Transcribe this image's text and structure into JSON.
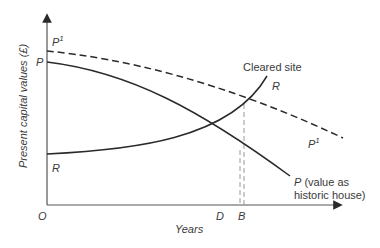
{
  "diagram": {
    "axes": {
      "y_label": "Present capital values (£)",
      "x_label": "Years",
      "origin": "O"
    },
    "curves": {
      "P_start_label": "P",
      "P1_start_label": "P",
      "P1_start_sup": "1",
      "P1_end_label": "P",
      "P1_end_sup": "1",
      "R_start_label": "R",
      "R_end_label": "R",
      "cleared_site_label": "Cleared site",
      "P_end_label": "P",
      "P_end_desc_1": " (value as",
      "P_end_desc_2": "historic  house)"
    },
    "x_markers": {
      "D": "D",
      "B": "B"
    },
    "colors": {
      "line": "#2a2a2a",
      "dashed": "#2a2a2a",
      "guide": "#9a9a9a",
      "text": "#3a3a3a"
    }
  }
}
